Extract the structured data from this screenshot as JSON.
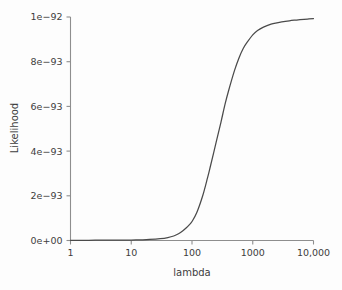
{
  "chart_data": {
    "type": "line",
    "title": "",
    "subtitle": "",
    "xlabel": "lambda",
    "ylabel": "Likelihood",
    "xscale": "log",
    "yscale": "linear",
    "xlim": [
      1,
      10000
    ],
    "ylim": [
      0,
      1e-92
    ],
    "grid": false,
    "legend": null,
    "annotations": [],
    "xticks": [
      1,
      10,
      100,
      1000,
      10000
    ],
    "xtick_labels": [
      "1",
      "10",
      "100",
      "1000",
      "10,000"
    ],
    "yticks": [
      0,
      2e-93,
      4e-93,
      6e-93,
      8e-93,
      1e-92
    ],
    "ytick_labels": [
      "0e+00",
      "2e-93",
      "4e-93",
      "6e-93",
      "8e-93",
      "1e-92"
    ],
    "series": [
      {
        "name": "likelihood",
        "color": "#4a4a4a",
        "x": [
          1,
          2,
          3,
          5,
          7,
          10,
          15,
          20,
          30,
          40,
          50,
          60,
          70,
          80,
          90,
          100,
          120,
          150,
          180,
          200,
          250,
          300,
          350,
          400,
          500,
          600,
          700,
          800,
          1000,
          1200,
          1500,
          2000,
          2500,
          3000,
          4000,
          5000,
          6000,
          8000,
          10000
        ],
        "y": [
          1e-95,
          1.1e-95,
          1.2e-95,
          1.4e-95,
          1.7e-95,
          2.2e-95,
          3.2e-95,
          4.5e-95,
          8e-95,
          1.3e-94,
          2e-94,
          3e-94,
          4.2e-94,
          5.6e-94,
          7e-94,
          8.5e-94,
          1.25e-93,
          2e-93,
          2.8e-93,
          3.3e-93,
          4.4e-93,
          5.3e-93,
          6.1e-93,
          6.7e-93,
          7.6e-93,
          8.2e-93,
          8.6e-93,
          8.85e-93,
          9.2e-93,
          9.4e-93,
          9.55e-93,
          9.68e-93,
          9.74e-93,
          9.78e-93,
          9.83e-93,
          9.86e-93,
          9.88e-93,
          9.91e-93,
          9.93e-93
        ]
      }
    ]
  },
  "axes": {
    "y_title": "Likelihood",
    "x_title": "lambda"
  },
  "colors": {
    "curve": "#4a4a4a",
    "axis": "#8e8e8e",
    "text": "#3d3d3d",
    "background": "#fdfdfd"
  }
}
